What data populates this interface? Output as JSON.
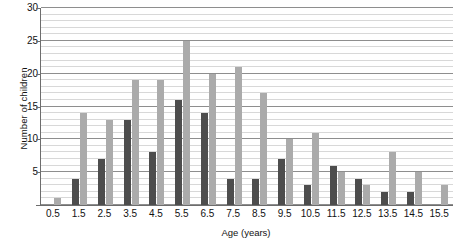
{
  "chart_data": {
    "type": "bar",
    "title": "",
    "xlabel": "Age (years)",
    "ylabel": "Number of children",
    "categories": [
      "0.5",
      "1.5",
      "2.5",
      "3.5",
      "4.5",
      "5.5",
      "6.5",
      "7.5",
      "8.5",
      "9.5",
      "10.5",
      "11.5",
      "12.5",
      "13.5",
      "14.5",
      "15.5"
    ],
    "series": [
      {
        "name": "dark-series",
        "color": "#4d4d4d",
        "values": [
          0,
          4,
          7,
          13,
          8,
          16,
          14,
          4,
          4,
          7,
          3,
          6,
          4,
          2,
          2,
          0
        ]
      },
      {
        "name": "light-series",
        "color": "#ababab",
        "values": [
          1,
          14,
          13,
          19,
          19,
          25,
          20,
          21,
          17,
          10,
          11,
          5,
          3,
          8,
          5,
          3
        ]
      }
    ],
    "ylim": [
      0,
      30
    ],
    "yticks": [
      0,
      5,
      10,
      15,
      20,
      25,
      30
    ],
    "ytick_labels": [
      "",
      "5",
      "10",
      "15",
      "20",
      "25",
      "30"
    ],
    "y_minor_step": 1,
    "grid": true,
    "legend": "none"
  }
}
